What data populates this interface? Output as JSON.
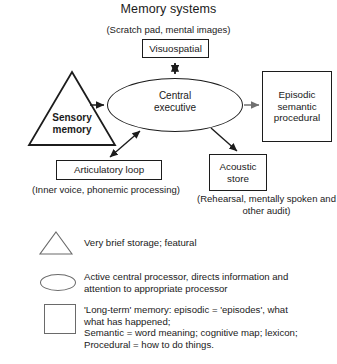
{
  "title": "Memory systems",
  "captions": {
    "scratch_pad": "(Scratch pad, mental images)",
    "inner_voice": "(Inner voice, phonemic processing)",
    "rehearsal": "(Rehearsal, mentally spoken and other audit)"
  },
  "nodes": {
    "visuospatial": "Visuospatial",
    "central_executive": "Central\nexecutive",
    "central_executive_line1": "Central",
    "central_executive_line2": "executive",
    "sensory_memory_line1": "Sensory",
    "sensory_memory_line2": "memory",
    "articulatory_loop": "Articulatory loop",
    "acoustic_store_line1": "Acoustic",
    "acoustic_store_line2": "store",
    "episodic_line1": "Episodic",
    "episodic_line2": "semantic",
    "episodic_line3": "procedural"
  },
  "legend": {
    "triangle": "Very brief storage; featural",
    "ellipse_line1": "Active central processor, directs information and",
    "ellipse_line2": "attention to appropriate processor",
    "square_line1": "'Long-term' memory: episodic = 'episodes', what",
    "square_line2": "what has happened;",
    "square_line3": "Semantic = word meaning; cognitive map; lexicon;",
    "square_line4": "Procedural = how to do things."
  },
  "colors": {
    "stroke": "#1c1c1c",
    "text": "#1a1a1a",
    "legend_stroke": "#6a6a6a",
    "gray_arrow": "#707070",
    "background": "#ffffff"
  }
}
